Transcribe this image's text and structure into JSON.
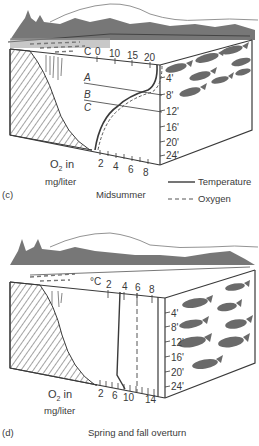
{
  "panels": [
    {
      "id": "c",
      "panel_label": "(c)",
      "title": "Midsummer",
      "temperature_axis": {
        "unit": "C",
        "ticks": [
          "0",
          "10",
          "15",
          "20"
        ]
      },
      "oxygen_axis": {
        "label": "O",
        "subscript": "2",
        "label_suffix": " in",
        "unit": "mg/liter",
        "ticks": [
          "2",
          "4",
          "6",
          "8"
        ]
      },
      "depth_axis": {
        "ticks": [
          "4'",
          "8'",
          "12'",
          "16'",
          "20'",
          "24'"
        ]
      },
      "layers": [
        "A",
        "B",
        "C"
      ],
      "legend": [
        {
          "label": "Temperature",
          "style": "solid"
        },
        {
          "label": "Oxygen",
          "style": "dashed"
        }
      ]
    },
    {
      "id": "d",
      "panel_label": "(d)",
      "title": "Spring and fall overturn",
      "temperature_axis": {
        "unit": "°C",
        "ticks": [
          "2",
          "4",
          "6",
          "8"
        ]
      },
      "oxygen_axis": {
        "label": "O",
        "subscript": "2",
        "label_suffix": " in",
        "unit": "mg/liter",
        "ticks": [
          "2",
          "6",
          "10",
          "14"
        ]
      },
      "depth_axis": {
        "ticks": [
          "4'",
          "8'",
          "12'",
          "16'",
          "20'",
          "24'"
        ]
      }
    }
  ],
  "colors": {
    "ink": "#3a3a3a",
    "fish": "#6a6a6a",
    "hatch": "#555555",
    "paper": "#ffffff"
  }
}
